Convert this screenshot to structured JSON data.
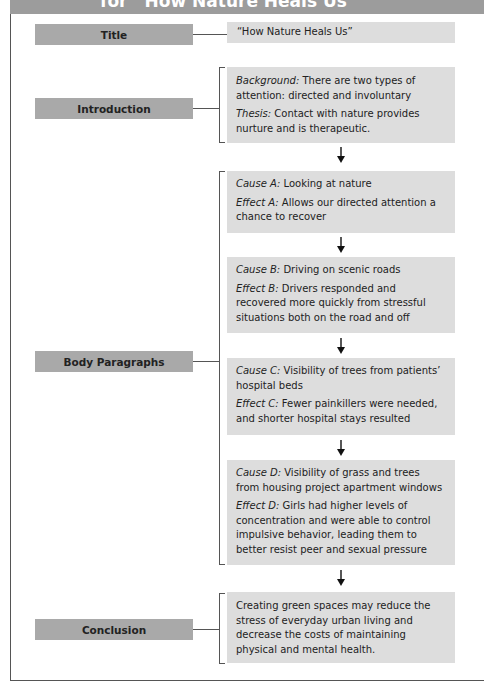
{
  "header": {
    "title": "for “How Nature Heals Us”"
  },
  "colors": {
    "header_bar": "#9c9c9c",
    "label_fill": "#a9a9a9",
    "box_fill": "#dddddd",
    "line": "#555555"
  },
  "rows": {
    "title": {
      "label": "Title",
      "text": "“How Nature Heals Us”"
    },
    "introduction": {
      "label": "Introduction",
      "background_label": "Background:",
      "background_text": " There are two types of attention: directed and involuntary",
      "thesis_label": "Thesis:",
      "thesis_text": " Contact with nature provides nurture and is therapeutic."
    },
    "body": {
      "label": "Body Paragraphs",
      "items": [
        {
          "cause_label": "Cause A:",
          "cause_text": " Looking at nature",
          "effect_label": "Effect A:",
          "effect_text": " Allows our directed attention a chance to recover"
        },
        {
          "cause_label": "Cause B:",
          "cause_text": " Driving on scenic roads",
          "effect_label": "Effect B:",
          "effect_text": " Drivers responded and recovered more quickly from stressful situations both on the road and off"
        },
        {
          "cause_label": "Cause C:",
          "cause_text": " Visibility of trees from patients’ hospital beds",
          "effect_label": "Effect C:",
          "effect_text": " Fewer painkillers were needed, and shorter hospital stays resulted"
        },
        {
          "cause_label": "Cause D:",
          "cause_text": " Visibility of grass and trees from housing project apartment windows",
          "effect_label": "Effect D:",
          "effect_text": " Girls had higher levels of concentration and were able to control impulsive behavior, leading them to better resist peer and sexual pressure"
        }
      ]
    },
    "conclusion": {
      "label": "Conclusion",
      "text": "Creating green spaces may reduce the stress of everyday urban living and decrease the costs of maintaining physical and mental health."
    }
  },
  "icons": {
    "arrow": "down-arrow-icon"
  }
}
